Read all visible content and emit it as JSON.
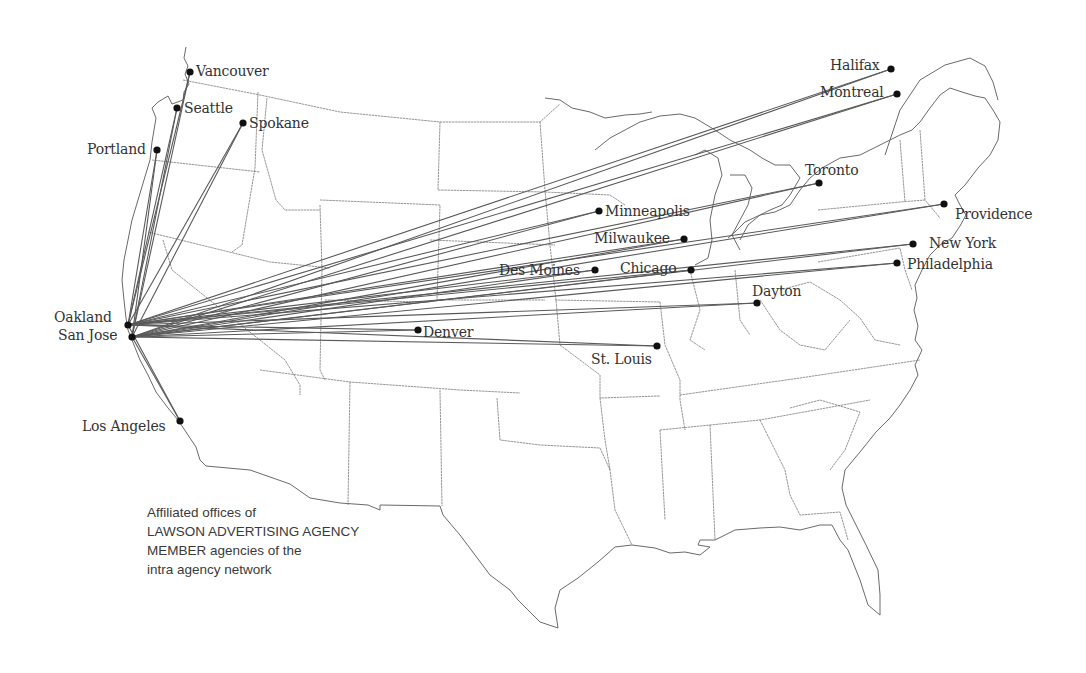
{
  "map": {
    "title": "Affiliated offices network map",
    "hub_cities": [
      "Oakland",
      "San Jose"
    ],
    "cities": [
      {
        "name": "Vancouver",
        "x": 190,
        "y": 72,
        "label_x": 196,
        "label_y": 63
      },
      {
        "name": "Seattle",
        "x": 177,
        "y": 108,
        "label_x": 184,
        "label_y": 100
      },
      {
        "name": "Spokane",
        "x": 243,
        "y": 123,
        "label_x": 249,
        "label_y": 115
      },
      {
        "name": "Portland",
        "x": 157,
        "y": 150,
        "label_x": 87,
        "label_y": 141
      },
      {
        "name": "Oakland",
        "x": 128,
        "y": 325,
        "label_x": 54,
        "label_y": 309
      },
      {
        "name": "San Jose",
        "x": 132,
        "y": 337,
        "label_x": 58,
        "label_y": 327
      },
      {
        "name": "Los Angeles",
        "x": 180,
        "y": 421,
        "label_x": 82,
        "label_y": 418
      },
      {
        "name": "Denver",
        "x": 418,
        "y": 330,
        "label_x": 423,
        "label_y": 324
      },
      {
        "name": "Halifax",
        "x": 891,
        "y": 69,
        "label_x": 830,
        "label_y": 57
      },
      {
        "name": "Montreal",
        "x": 897,
        "y": 94,
        "label_x": 820,
        "label_y": 84
      },
      {
        "name": "Toronto",
        "x": 819,
        "y": 183,
        "label_x": 805,
        "label_y": 162
      },
      {
        "name": "Providence",
        "x": 944,
        "y": 204,
        "label_x": 955,
        "label_y": 206
      },
      {
        "name": "New York",
        "x": 913,
        "y": 244,
        "label_x": 929,
        "label_y": 235
      },
      {
        "name": "Philadelphia",
        "x": 897,
        "y": 263,
        "label_x": 907,
        "label_y": 256
      },
      {
        "name": "Minneapolis",
        "x": 599,
        "y": 211,
        "label_x": 605,
        "label_y": 203
      },
      {
        "name": "Milwaukee",
        "x": 684,
        "y": 239,
        "label_x": 594,
        "label_y": 230
      },
      {
        "name": "Des Moines",
        "x": 595,
        "y": 270,
        "label_x": 499,
        "label_y": 262
      },
      {
        "name": "Chicago",
        "x": 691,
        "y": 270,
        "label_x": 620,
        "label_y": 260
      },
      {
        "name": "Dayton",
        "x": 757,
        "y": 303,
        "label_x": 752,
        "label_y": 283
      },
      {
        "name": "St. Louis",
        "x": 657,
        "y": 346,
        "label_x": 591,
        "label_y": 351
      }
    ],
    "colors": {
      "route": "#5a5a5a",
      "border": "#6a6a6a",
      "dot": "#111111",
      "label": "#333333",
      "background": "#ffffff"
    }
  },
  "caption": {
    "line1": "Affiliated offices of",
    "line2": "LAWSON ADVERTISING AGENCY",
    "line3": "MEMBER agencies of the",
    "line4": "intra agency network"
  }
}
